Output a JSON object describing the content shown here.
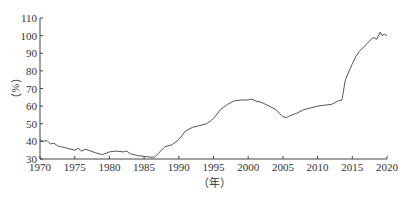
{
  "chart_data": {
    "type": "line",
    "title": "",
    "xlabel": "（年）",
    "ylabel": "（%）",
    "xlim": [
      1970,
      2020
    ],
    "ylim": [
      30,
      110
    ],
    "grid": false,
    "legend": null,
    "x_ticks": [
      "1970",
      "1975",
      "1980",
      "1985",
      "1990",
      "1995",
      "2000",
      "2005",
      "2010",
      "2015",
      "2020"
    ],
    "y_ticks": [
      "30",
      "40",
      "50",
      "60",
      "70",
      "80",
      "90",
      "100",
      "110"
    ],
    "series": [
      {
        "name": "ratio",
        "color": "#555555",
        "x": [
          1970,
          1970.5,
          1971,
          1971.5,
          1972,
          1972.5,
          1973,
          1974,
          1975,
          1975.5,
          1976,
          1976.5,
          1977,
          1978,
          1979,
          1980,
          1981,
          1982,
          1982.5,
          1983,
          1984,
          1985,
          1986,
          1986.5,
          1987,
          1988,
          1989,
          1990,
          1991,
          1992,
          1993,
          1994,
          1995,
          1996,
          1997,
          1998,
          1999,
          2000,
          2000.5,
          2001,
          2002,
          2003,
          2004,
          2005,
          2005.5,
          2006,
          2007,
          2008,
          2009,
          2010,
          2011,
          2012,
          2013,
          2013.5,
          2014,
          2015,
          2015.5,
          2016,
          2017,
          2018,
          2018.5,
          2019,
          2019.3,
          2019.6,
          2020
        ],
        "values": [
          41,
          40,
          40.5,
          38.5,
          39,
          37.5,
          37,
          36,
          35,
          36,
          34.5,
          35.5,
          35,
          33.5,
          32.5,
          34,
          34.5,
          34,
          34.5,
          33,
          32,
          31.5,
          31,
          31,
          33,
          37,
          38,
          41,
          46,
          48,
          49,
          50,
          53,
          58,
          61,
          63,
          63.5,
          63.5,
          64,
          63,
          62,
          60,
          58,
          54,
          53.5,
          54.5,
          56,
          58,
          59,
          60,
          60.5,
          61,
          63,
          63.5,
          75,
          84,
          88,
          91,
          95,
          99,
          98,
          102,
          100,
          101,
          100
        ]
      }
    ]
  }
}
